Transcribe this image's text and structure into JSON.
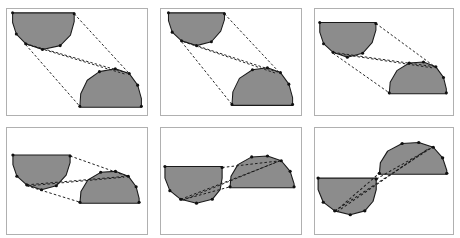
{
  "figure": {
    "title": "Shape correspondence sequence",
    "panel_count": 6,
    "rows": 2,
    "columns": 3,
    "background_color": "#ffffff",
    "shape_fill_color": "#8c8c8c",
    "shape_outline_color": "#1a1a1a",
    "correspondence_line_color": "#1a1a1a",
    "panel_border_color": "#b0b0b0",
    "vertex_marker_color": "#101010"
  },
  "chart_data": {
    "type": "diagram",
    "title": "Shape correspondence sequence",
    "panels": [
      {
        "index": 1,
        "label": "panel-1",
        "shapes": [
          {
            "name": "bowl-shape",
            "type": "concave-bowl",
            "anchor": "top-left",
            "points": [
              [
                6,
                4
              ],
              [
                6,
                14
              ],
              [
                10,
                26
              ],
              [
                20,
                36
              ],
              [
                38,
                42
              ],
              [
                57,
                38
              ],
              [
                68,
                27
              ],
              [
                72,
                13
              ],
              [
                72,
                4
              ]
            ]
          },
          {
            "name": "dome-shape",
            "type": "convex-dome",
            "anchor": "bottom-right",
            "points": [
              [
                78,
                102
              ],
              [
                79,
                88
              ],
              [
                86,
                74
              ],
              [
                99,
                65
              ],
              [
                116,
                62
              ],
              [
                131,
                67
              ],
              [
                140,
                79
              ],
              [
                144,
                93
              ],
              [
                144,
                102
              ]
            ]
          }
        ],
        "correspondence_lines": [
          [
            [
              72,
              5
            ],
            [
              131,
              67
            ]
          ],
          [
            [
              20,
              36
            ],
            [
              131,
              67
            ]
          ],
          [
            [
              22,
              37
            ],
            [
              128,
              68
            ]
          ],
          [
            [
              20,
              37
            ],
            [
              78,
              101
            ]
          ]
        ],
        "vertices": [
          [
            6,
            4
          ],
          [
            10,
            26
          ],
          [
            20,
            36
          ],
          [
            38,
            42
          ],
          [
            57,
            38
          ],
          [
            72,
            5
          ],
          [
            99,
            65
          ],
          [
            116,
            62
          ],
          [
            131,
            67
          ],
          [
            140,
            79
          ],
          [
            78,
            101
          ],
          [
            144,
            101
          ]
        ]
      },
      {
        "index": 2,
        "label": "panel-2",
        "shapes": [
          {
            "name": "bowl-shape",
            "type": "concave-bowl",
            "anchor": "top-left",
            "points": [
              [
                8,
                4
              ],
              [
                8,
                12
              ],
              [
                12,
                24
              ],
              [
                22,
                33
              ],
              [
                38,
                38
              ],
              [
                54,
                34
              ],
              [
                64,
                23
              ],
              [
                68,
                11
              ],
              [
                68,
                4
              ]
            ]
          },
          {
            "name": "dome-shape",
            "type": "convex-dome",
            "anchor": "bottom-right",
            "points": [
              [
                76,
                100
              ],
              [
                77,
                86
              ],
              [
                84,
                72
              ],
              [
                98,
                63
              ],
              [
                114,
                61
              ],
              [
                128,
                66
              ],
              [
                137,
                78
              ],
              [
                141,
                92
              ],
              [
                141,
                100
              ]
            ]
          }
        ],
        "correspondence_lines": [
          [
            [
              68,
              5
            ],
            [
              127,
              66
            ]
          ],
          [
            [
              22,
              33
            ],
            [
              127,
              66
            ]
          ],
          [
            [
              24,
              34
            ],
            [
              124,
              67
            ]
          ],
          [
            [
              22,
              34
            ],
            [
              76,
              99
            ]
          ]
        ],
        "vertices": [
          [
            8,
            4
          ],
          [
            12,
            24
          ],
          [
            22,
            33
          ],
          [
            38,
            38
          ],
          [
            54,
            34
          ],
          [
            68,
            5
          ],
          [
            98,
            63
          ],
          [
            114,
            61
          ],
          [
            128,
            66
          ],
          [
            137,
            78
          ],
          [
            76,
            99
          ],
          [
            141,
            99
          ]
        ]
      },
      {
        "index": 3,
        "label": "panel-3",
        "shapes": [
          {
            "name": "bowl-shape",
            "type": "concave-bowl",
            "anchor": "top-left",
            "points": [
              [
                5,
                14
              ],
              [
                5,
                24
              ],
              [
                9,
                36
              ],
              [
                19,
                45
              ],
              [
                34,
                50
              ],
              [
                50,
                46
              ],
              [
                60,
                35
              ],
              [
                64,
                22
              ],
              [
                64,
                14
              ]
            ]
          },
          {
            "name": "dome-shape",
            "type": "convex-dome",
            "anchor": "bottom-right",
            "points": [
              [
                78,
                88
              ],
              [
                79,
                76
              ],
              [
                86,
                64
              ],
              [
                99,
                56
              ],
              [
                114,
                55
              ],
              [
                127,
                60
              ],
              [
                135,
                71
              ],
              [
                138,
                83
              ],
              [
                138,
                88
              ]
            ]
          }
        ],
        "correspondence_lines": [
          [
            [
              64,
              15
            ],
            [
              126,
              60
            ]
          ],
          [
            [
              19,
              45
            ],
            [
              126,
              60
            ]
          ],
          [
            [
              21,
              46
            ],
            [
              123,
              61
            ]
          ],
          [
            [
              19,
              46
            ],
            [
              78,
              87
            ]
          ]
        ],
        "vertices": [
          [
            5,
            14
          ],
          [
            9,
            36
          ],
          [
            19,
            45
          ],
          [
            34,
            50
          ],
          [
            50,
            46
          ],
          [
            64,
            15
          ],
          [
            99,
            56
          ],
          [
            114,
            55
          ],
          [
            127,
            60
          ],
          [
            135,
            71
          ],
          [
            78,
            87
          ],
          [
            138,
            87
          ]
        ]
      },
      {
        "index": 4,
        "label": "panel-4",
        "shapes": [
          {
            "name": "bowl-shape",
            "type": "concave-bowl",
            "anchor": "mid-left",
            "points": [
              [
                6,
                28
              ],
              [
                6,
                38
              ],
              [
                10,
                50
              ],
              [
                20,
                59
              ],
              [
                35,
                64
              ],
              [
                50,
                60
              ],
              [
                60,
                49
              ],
              [
                64,
                36
              ],
              [
                64,
                28
              ]
            ]
          },
          {
            "name": "dome-shape",
            "type": "convex-dome",
            "anchor": "mid-right",
            "points": [
              [
                74,
                78
              ],
              [
                75,
                66
              ],
              [
                82,
                54
              ],
              [
                95,
                46
              ],
              [
                110,
                45
              ],
              [
                123,
                50
              ],
              [
                131,
                61
              ],
              [
                134,
                73
              ],
              [
                134,
                78
              ]
            ]
          }
        ],
        "correspondence_lines": [
          [
            [
              64,
              29
            ],
            [
              122,
              50
            ]
          ],
          [
            [
              20,
              59
            ],
            [
              122,
              50
            ]
          ],
          [
            [
              22,
              60
            ],
            [
              119,
              51
            ]
          ],
          [
            [
              20,
              60
            ],
            [
              74,
              77
            ]
          ]
        ],
        "vertices": [
          [
            6,
            28
          ],
          [
            10,
            50
          ],
          [
            20,
            59
          ],
          [
            35,
            64
          ],
          [
            50,
            60
          ],
          [
            64,
            29
          ],
          [
            95,
            46
          ],
          [
            110,
            45
          ],
          [
            123,
            50
          ],
          [
            131,
            61
          ],
          [
            74,
            77
          ],
          [
            134,
            77
          ]
        ]
      },
      {
        "index": 5,
        "label": "panel-5",
        "shapes": [
          {
            "name": "bowl-shape",
            "type": "concave-bowl",
            "anchor": "left-adjacent",
            "points": [
              [
                4,
                40
              ],
              [
                4,
                52
              ],
              [
                9,
                65
              ],
              [
                20,
                74
              ],
              [
                36,
                78
              ],
              [
                52,
                74
              ],
              [
                60,
                64
              ],
              [
                62,
                52
              ],
              [
                62,
                40
              ]
            ]
          },
          {
            "name": "dome-shape",
            "type": "convex-dome",
            "anchor": "right-adjacent",
            "points": [
              [
                70,
                62
              ],
              [
                71,
                50
              ],
              [
                78,
                38
              ],
              [
                92,
                30
              ],
              [
                108,
                29
              ],
              [
                122,
                34
              ],
              [
                131,
                45
              ],
              [
                135,
                58
              ],
              [
                135,
                62
              ]
            ]
          }
        ],
        "correspondence_lines": [
          [
            [
              62,
              41
            ],
            [
              121,
              34
            ]
          ],
          [
            [
              20,
              74
            ],
            [
              121,
              34
            ]
          ],
          [
            [
              22,
              75
            ],
            [
              118,
              35
            ]
          ],
          [
            [
              20,
              75
            ],
            [
              70,
              61
            ]
          ]
        ],
        "vertices": [
          [
            4,
            40
          ],
          [
            9,
            65
          ],
          [
            20,
            74
          ],
          [
            36,
            78
          ],
          [
            52,
            74
          ],
          [
            62,
            41
          ],
          [
            92,
            30
          ],
          [
            108,
            29
          ],
          [
            122,
            34
          ],
          [
            131,
            45
          ],
          [
            70,
            61
          ],
          [
            135,
            61
          ]
        ]
      },
      {
        "index": 6,
        "label": "panel-6",
        "shapes": [
          {
            "name": "bowl-shape",
            "type": "concave-bowl",
            "anchor": "left-merged",
            "points": [
              [
                3,
                52
              ],
              [
                3,
                64
              ],
              [
                8,
                77
              ],
              [
                19,
                86
              ],
              [
                34,
                90
              ],
              [
                48,
                86
              ],
              [
                56,
                76
              ],
              [
                59,
                64
              ],
              [
                59,
                52
              ]
            ]
          },
          {
            "name": "dome-shape",
            "type": "convex-dome",
            "anchor": "right-merged",
            "points": [
              [
                62,
                48
              ],
              [
                63,
                36
              ],
              [
                70,
                24
              ],
              [
                84,
                16
              ],
              [
                100,
                15
              ],
              [
                114,
                20
              ],
              [
                123,
                31
              ],
              [
                127,
                44
              ],
              [
                127,
                48
              ]
            ]
          }
        ],
        "correspondence_lines": [
          [
            [
              59,
              53
            ],
            [
              113,
              20
            ]
          ],
          [
            [
              19,
              86
            ],
            [
              113,
              20
            ]
          ],
          [
            [
              21,
              87
            ],
            [
              110,
              21
            ]
          ],
          [
            [
              19,
              87
            ],
            [
              62,
              47
            ]
          ]
        ],
        "vertices": [
          [
            3,
            52
          ],
          [
            8,
            77
          ],
          [
            19,
            86
          ],
          [
            34,
            90
          ],
          [
            48,
            86
          ],
          [
            59,
            53
          ],
          [
            84,
            16
          ],
          [
            100,
            15
          ],
          [
            114,
            20
          ],
          [
            123,
            31
          ],
          [
            62,
            47
          ],
          [
            127,
            47
          ]
        ]
      }
    ]
  }
}
